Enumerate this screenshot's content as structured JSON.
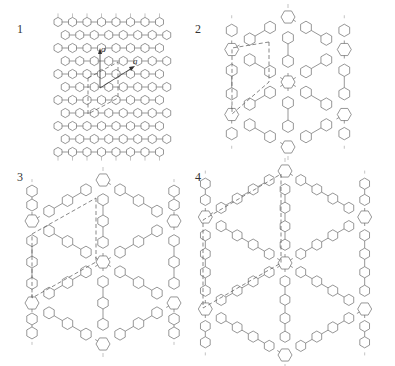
{
  "figure": {
    "panels": [
      {
        "id": 1,
        "label": "1",
        "description": "dense polyphenylene network with lattice vectors",
        "vector_labels": [
          "a",
          "a"
        ],
        "spacer_rings": 1
      },
      {
        "id": 2,
        "label": "2",
        "description": "hexaphenylbenzene-node network, biphenyl linkers",
        "spacer_rings": 2
      },
      {
        "id": 3,
        "label": "3",
        "description": "hexaphenylbenzene-node network, terphenyl linkers",
        "spacer_rings": 3
      },
      {
        "id": 4,
        "label": "4",
        "description": "hexaphenylbenzene-node network, quaterphenyl linkers",
        "spacer_rings": 4
      }
    ],
    "colors": {
      "line": "#6a6a6a",
      "dash": "#555555",
      "label": "#333333",
      "background": "#ffffff"
    }
  }
}
